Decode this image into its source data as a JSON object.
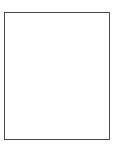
{
  "figure": {
    "title": "",
    "colors": {
      "background": "#ffffff",
      "border": "#4a4a4a",
      "divider": "#4a4a4a",
      "fill_unshaded": "#ffffff",
      "fill_shaded": "#b0b0b0"
    },
    "frame": {
      "x": 4,
      "y": 12,
      "width": 106,
      "height": 128,
      "border_width": 1.5
    },
    "dividers": [
      {
        "name": "vertical-divider",
        "orientation": "vertical",
        "position": 57,
        "thickness": 1.5
      },
      {
        "name": "horizontal-divider",
        "orientation": "horizontal",
        "position": 79,
        "thickness": 1.5
      }
    ],
    "quadrants": [
      {
        "id": "top-left",
        "label": "",
        "shaded": false,
        "x": 4,
        "y": 12,
        "width": 53,
        "height": 67
      },
      {
        "id": "top-right",
        "label": "",
        "shaded": false,
        "x": 57,
        "y": 12,
        "width": 53,
        "height": 67
      },
      {
        "id": "bottom-left",
        "label": "",
        "shaded": false,
        "x": 4,
        "y": 79,
        "width": 53,
        "height": 61
      },
      {
        "id": "bottom-right",
        "label": "",
        "shaded": true,
        "x": 57,
        "y": 79,
        "width": 53,
        "height": 61
      }
    ]
  }
}
